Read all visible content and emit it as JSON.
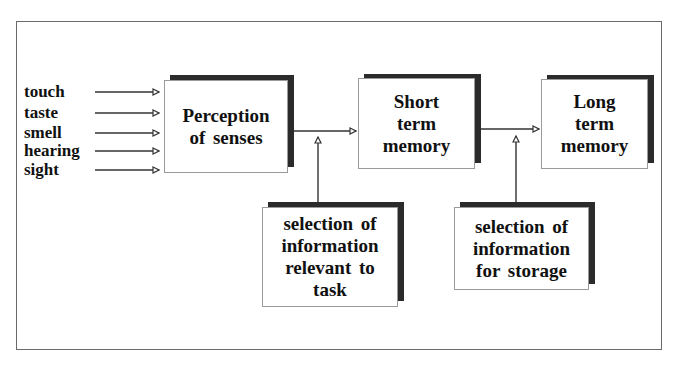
{
  "diagram": {
    "senses": [
      {
        "label": "touch"
      },
      {
        "label": "taste"
      },
      {
        "label": "smell"
      },
      {
        "label": "hearing"
      },
      {
        "label": "sight"
      }
    ],
    "boxes": {
      "perception": {
        "text": "Perception\nof senses"
      },
      "short_term": {
        "text": "Short\nterm\nmemory"
      },
      "long_term": {
        "text": "Long\nterm\nmemory"
      },
      "selection_task": {
        "text": "selection of\ninformation\nrelevant to\ntask"
      },
      "selection_storage": {
        "text": "selection of\ninformation\nfor storage"
      }
    },
    "colors": {
      "line": "#333333",
      "shadow": "#2b2b2b",
      "frame": "#6a6a6a"
    }
  }
}
